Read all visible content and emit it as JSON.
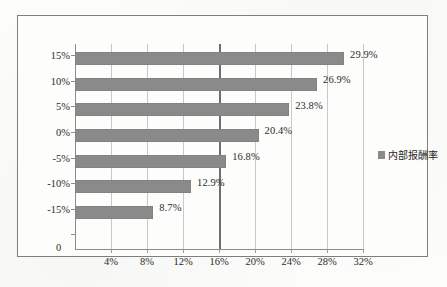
{
  "chart_data": {
    "type": "bar",
    "orientation": "horizontal",
    "title": "",
    "xlabel": "",
    "ylabel": "",
    "categories": [
      "15%",
      "10%",
      "5%",
      "0%",
      "-5%",
      "-10%",
      "-15%"
    ],
    "values": [
      29.9,
      26.9,
      23.8,
      20.4,
      16.8,
      12.9,
      8.7
    ],
    "value_labels": [
      "29.9%",
      "26.9%",
      "23.8%",
      "20.4%",
      "16.8%",
      "12.9%",
      "8.7%"
    ],
    "series": [
      {
        "name": "内部报酬率",
        "values": [
          29.9,
          26.9,
          23.8,
          20.4,
          16.8,
          12.9,
          8.7
        ],
        "color": "#8a8a8a"
      }
    ],
    "xlim": [
      0,
      32
    ],
    "xticks": [
      4,
      8,
      12,
      16,
      20,
      24,
      28,
      32
    ],
    "xtick_labels": [
      "4%",
      "8%",
      "12%",
      "16%",
      "20%",
      "24%",
      "28%",
      "32%"
    ],
    "origin_label": "0",
    "grid": true,
    "grid_axis": "x",
    "emphasis_gridline": 16,
    "legend_position": "right"
  },
  "legend": {
    "entries": [
      {
        "label": "内部报酬率",
        "color": "#8a8a8a"
      }
    ]
  },
  "caption": ""
}
